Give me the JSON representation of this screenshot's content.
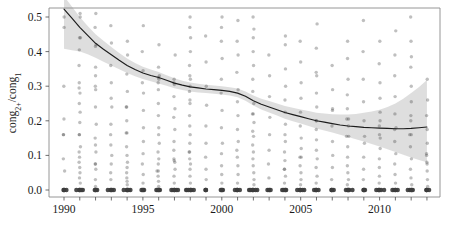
{
  "chart_data": {
    "type": "scatter",
    "title": "",
    "subtitle": "",
    "xlabel": "",
    "ylabel": "cong2+/cong1",
    "ylabel_parts": {
      "base1": "cong",
      "sub1": "2+",
      "slash": "/",
      "base2": "cong",
      "sub2": "1"
    },
    "xlim": [
      1989.4,
      2013.6
    ],
    "ylim": [
      0.0,
      0.53
    ],
    "grid": false,
    "legend": "none",
    "x_ticks": [
      1990,
      1995,
      2000,
      2005,
      2010
    ],
    "x_tick_labels": [
      "1990",
      "1995",
      "2000",
      "2005",
      "2010"
    ],
    "x_minor_ticks": [
      1990,
      1991,
      1992,
      1993,
      1994,
      1995,
      1996,
      1997,
      1998,
      1999,
      2000,
      2001,
      2002,
      2003,
      2004,
      2005,
      2006,
      2007,
      2008,
      2009,
      2010,
      2011,
      2012,
      2013
    ],
    "y_ticks": [
      0.0,
      0.1,
      0.2,
      0.3,
      0.4,
      0.5
    ],
    "y_tick_labels": [
      "0.0",
      "0.1",
      "0.2",
      "0.3",
      "0.4",
      "0.5"
    ],
    "marker": {
      "shape": "circle",
      "color": "#3c3c3c",
      "opacity": 0.33,
      "radius": 1.7
    },
    "colors": {
      "point": "#3c3c3c",
      "trend": "#1c1c1c",
      "band": "#c9c9c9",
      "frame": "#8a8a8a",
      "text": "#1a1a1a"
    },
    "trend": {
      "name": "LOESS smoother",
      "x": [
        1990,
        1990.5,
        1991,
        1991.5,
        1992,
        1992.5,
        1993,
        1993.5,
        1994,
        1994.5,
        1995,
        1995.5,
        1996,
        1996.5,
        1997,
        1997.5,
        1998,
        1998.5,
        1999,
        1999.5,
        2000,
        2000.5,
        2001,
        2001.5,
        2002,
        2002.5,
        2003,
        2003.5,
        2004,
        2004.5,
        2005,
        2005.5,
        2006,
        2006.5,
        2007,
        2007.5,
        2008,
        2008.5,
        2009,
        2009.5,
        2010,
        2010.5,
        2011,
        2011.5,
        2012,
        2012.5,
        2013
      ],
      "y": [
        0.523,
        0.497,
        0.47,
        0.447,
        0.424,
        0.407,
        0.391,
        0.375,
        0.36,
        0.348,
        0.338,
        0.331,
        0.325,
        0.317,
        0.309,
        0.303,
        0.298,
        0.295,
        0.292,
        0.29,
        0.288,
        0.285,
        0.28,
        0.271,
        0.258,
        0.248,
        0.24,
        0.232,
        0.224,
        0.218,
        0.212,
        0.206,
        0.2,
        0.196,
        0.192,
        0.188,
        0.185,
        0.183,
        0.181,
        0.18,
        0.179,
        0.178,
        0.177,
        0.177,
        0.178,
        0.18,
        0.182
      ]
    },
    "confidence_band": {
      "level": "95%",
      "x": [
        1990,
        1990.5,
        1991,
        1991.5,
        1992,
        1992.5,
        1993,
        1993.5,
        1994,
        1994.5,
        1995,
        1995.5,
        1996,
        1996.5,
        1997,
        1997.5,
        1998,
        1998.5,
        1999,
        1999.5,
        2000,
        2000.5,
        2001,
        2001.5,
        2002,
        2002.5,
        2003,
        2003.5,
        2004,
        2004.5,
        2005,
        2005.5,
        2006,
        2006.5,
        2007,
        2007.5,
        2008,
        2008.5,
        2009,
        2009.5,
        2010,
        2010.5,
        2011,
        2011.5,
        2012,
        2012.5,
        2013
      ],
      "upper": [
        0.56,
        0.53,
        0.5,
        0.474,
        0.45,
        0.431,
        0.413,
        0.396,
        0.38,
        0.367,
        0.356,
        0.348,
        0.341,
        0.332,
        0.323,
        0.316,
        0.311,
        0.307,
        0.304,
        0.302,
        0.3,
        0.297,
        0.293,
        0.285,
        0.273,
        0.264,
        0.257,
        0.25,
        0.243,
        0.238,
        0.233,
        0.228,
        0.223,
        0.221,
        0.219,
        0.218,
        0.218,
        0.22,
        0.223,
        0.227,
        0.232,
        0.24,
        0.25,
        0.264,
        0.28,
        0.298,
        0.318
      ],
      "lower": [
        0.408,
        0.404,
        0.4,
        0.392,
        0.382,
        0.371,
        0.36,
        0.349,
        0.338,
        0.329,
        0.321,
        0.314,
        0.308,
        0.301,
        0.294,
        0.289,
        0.285,
        0.282,
        0.28,
        0.278,
        0.276,
        0.273,
        0.268,
        0.258,
        0.244,
        0.233,
        0.224,
        0.215,
        0.206,
        0.199,
        0.192,
        0.185,
        0.178,
        0.172,
        0.166,
        0.16,
        0.153,
        0.147,
        0.14,
        0.133,
        0.126,
        0.118,
        0.11,
        0.102,
        0.094,
        0.087,
        0.08
      ]
    },
    "series": [
      {
        "name": "observations",
        "note": "one vertical column of overplotted observations per year; value 0.0 heavily saturated",
        "points_by_year": [
          {
            "x": 1990,
            "values": [
              0.0,
              0.0,
              0.0,
              0.055,
              0.09,
              0.16,
              0.16,
              0.205,
              0.3,
              0.47,
              0.5
            ]
          },
          {
            "x": 1991,
            "values": [
              0.0,
              0.0,
              0.0,
              0.0,
              0.0,
              0.02,
              0.035,
              0.05,
              0.065,
              0.08,
              0.095,
              0.11,
              0.125,
              0.16,
              0.16,
              0.195,
              0.225,
              0.25,
              0.28,
              0.295,
              0.31,
              0.36,
              0.405,
              0.44,
              0.44,
              0.5,
              0.51
            ]
          },
          {
            "x": 1992,
            "values": [
              0.0,
              0.0,
              0.0,
              0.01,
              0.03,
              0.06,
              0.075,
              0.075,
              0.11,
              0.13,
              0.15,
              0.19,
              0.24,
              0.29,
              0.3,
              0.33,
              0.355,
              0.415,
              0.42,
              0.47,
              0.51
            ]
          },
          {
            "x": 1993,
            "values": [
              0.0,
              0.0,
              0.0,
              0.0,
              0.03,
              0.05,
              0.075,
              0.1,
              0.13,
              0.16,
              0.19,
              0.24,
              0.265,
              0.31,
              0.36,
              0.425,
              0.475
            ]
          },
          {
            "x": 1994,
            "values": [
              0.0,
              0.0,
              0.0,
              0.0,
              0.0,
              0.015,
              0.025,
              0.035,
              0.05,
              0.065,
              0.08,
              0.1,
              0.125,
              0.165,
              0.165,
              0.2,
              0.24,
              0.24,
              0.285,
              0.335,
              0.39,
              0.43
            ]
          },
          {
            "x": 1995,
            "values": [
              0.0,
              0.0,
              0.0,
              0.02,
              0.045,
              0.075,
              0.105,
              0.14,
              0.18,
              0.23,
              0.28,
              0.31,
              0.345,
              0.4,
              0.475
            ]
          },
          {
            "x": 1996,
            "values": [
              0.0,
              0.0,
              0.0,
              0.0,
              0.01,
              0.025,
              0.04,
              0.055,
              0.055,
              0.075,
              0.09,
              0.11,
              0.135,
              0.16,
              0.18,
              0.215,
              0.25,
              0.29,
              0.31,
              0.32,
              0.325,
              0.33,
              0.355,
              0.42
            ]
          },
          {
            "x": 1997,
            "values": [
              0.0,
              0.0,
              0.0,
              0.0,
              0.0,
              0.02,
              0.04,
              0.06,
              0.08,
              0.085,
              0.09,
              0.115,
              0.14,
              0.175,
              0.21,
              0.235,
              0.27,
              0.305,
              0.31,
              0.32,
              0.39
            ]
          },
          {
            "x": 1998,
            "values": [
              0.0,
              0.0,
              0.0,
              0.0,
              0.0,
              0.0,
              0.02,
              0.04,
              0.06,
              0.075,
              0.09,
              0.11,
              0.11,
              0.135,
              0.16,
              0.185,
              0.215,
              0.25,
              0.26,
              0.285,
              0.3,
              0.32,
              0.33,
              0.36,
              0.4,
              0.44,
              0.47,
              0.5
            ]
          },
          {
            "x": 1999,
            "values": [
              0.0,
              0.0,
              0.03,
              0.06,
              0.095,
              0.135,
              0.185,
              0.245,
              0.3,
              0.37,
              0.445
            ]
          },
          {
            "x": 2000,
            "values": [
              0.0,
              0.0,
              0.0,
              0.02,
              0.045,
              0.07,
              0.105,
              0.135,
              0.18,
              0.23,
              0.28,
              0.32,
              0.38,
              0.43,
              0.47,
              0.5
            ]
          },
          {
            "x": 2001,
            "values": [
              0.0,
              0.0,
              0.0,
              0.0,
              0.02,
              0.045,
              0.07,
              0.095,
              0.115,
              0.14,
              0.175,
              0.215,
              0.255,
              0.29,
              0.34,
              0.39,
              0.43,
              0.49
            ]
          },
          {
            "x": 2002,
            "values": [
              0.0,
              0.0,
              0.0,
              0.0,
              0.0,
              0.0,
              0.015,
              0.03,
              0.05,
              0.07,
              0.09,
              0.11,
              0.13,
              0.155,
              0.17,
              0.195,
              0.22,
              0.22,
              0.25,
              0.285,
              0.32,
              0.36,
              0.4,
              0.44,
              0.465,
              0.5
            ]
          },
          {
            "x": 2003,
            "values": [
              0.0,
              0.0,
              0.0,
              0.035,
              0.075,
              0.115,
              0.16,
              0.21,
              0.27,
              0.33,
              0.39
            ]
          },
          {
            "x": 2004,
            "values": [
              0.0,
              0.0,
              0.0,
              0.0,
              0.02,
              0.04,
              0.06,
              0.06,
              0.085,
              0.11,
              0.14,
              0.16,
              0.19,
              0.225,
              0.26,
              0.3,
              0.35,
              0.42,
              0.445
            ]
          },
          {
            "x": 2005,
            "values": [
              0.0,
              0.0,
              0.0,
              0.0,
              0.0,
              0.015,
              0.03,
              0.05,
              0.07,
              0.095,
              0.095,
              0.12,
              0.15,
              0.185,
              0.225,
              0.265,
              0.31,
              0.37,
              0.43
            ]
          },
          {
            "x": 2006,
            "values": [
              0.0,
              0.0,
              0.0,
              0.0,
              0.02,
              0.04,
              0.065,
              0.09,
              0.115,
              0.145,
              0.175,
              0.2,
              0.2,
              0.24,
              0.28,
              0.33,
              0.34,
              0.41,
              0.48
            ]
          },
          {
            "x": 2007,
            "values": [
              0.0,
              0.0,
              0.0,
              0.03,
              0.065,
              0.1,
              0.14,
              0.185,
              0.23,
              0.235,
              0.29,
              0.36
            ]
          },
          {
            "x": 2008,
            "values": [
              0.0,
              0.0,
              0.0,
              0.0,
              0.0,
              0.015,
              0.03,
              0.05,
              0.07,
              0.095,
              0.125,
              0.155,
              0.155,
              0.185,
              0.205,
              0.205,
              0.235,
              0.275,
              0.32,
              0.38,
              0.43
            ]
          },
          {
            "x": 2009,
            "values": [
              0.0,
              0.0,
              0.0,
              0.03,
              0.06,
              0.095,
              0.135,
              0.155,
              0.2,
              0.255,
              0.32,
              0.4,
              0.49
            ]
          },
          {
            "x": 2010,
            "values": [
              0.0,
              0.0,
              0.0,
              0.0,
              0.0,
              0.02,
              0.04,
              0.065,
              0.09,
              0.12,
              0.15,
              0.16,
              0.185,
              0.2,
              0.225,
              0.265,
              0.31,
              0.365,
              0.43
            ]
          },
          {
            "x": 2011,
            "values": [
              0.0,
              0.0,
              0.0,
              0.0,
              0.02,
              0.045,
              0.075,
              0.105,
              0.14,
              0.18,
              0.175,
              0.22,
              0.27,
              0.33,
              0.39,
              0.46
            ]
          },
          {
            "x": 2012,
            "values": [
              0.0,
              0.0,
              0.0,
              0.0,
              0.015,
              0.035,
              0.06,
              0.09,
              0.125,
              0.16,
              0.16,
              0.2,
              0.215,
              0.255,
              0.3,
              0.355,
              0.385,
              0.43,
              0.5
            ]
          },
          {
            "x": 2013,
            "values": [
              0.0,
              0.0,
              0.0,
              0.01,
              0.03,
              0.055,
              0.075,
              0.08,
              0.1,
              0.105,
              0.135,
              0.175,
              0.215,
              0.26,
              0.32
            ]
          }
        ]
      }
    ]
  },
  "geometry": {
    "plot_left": 49,
    "plot_right": 440,
    "plot_top": 8,
    "plot_bottom": 197,
    "x_at_1990": 64,
    "px_per_year": 15.78,
    "y_at_0": 190,
    "px_per_0_1": 34.6
  }
}
